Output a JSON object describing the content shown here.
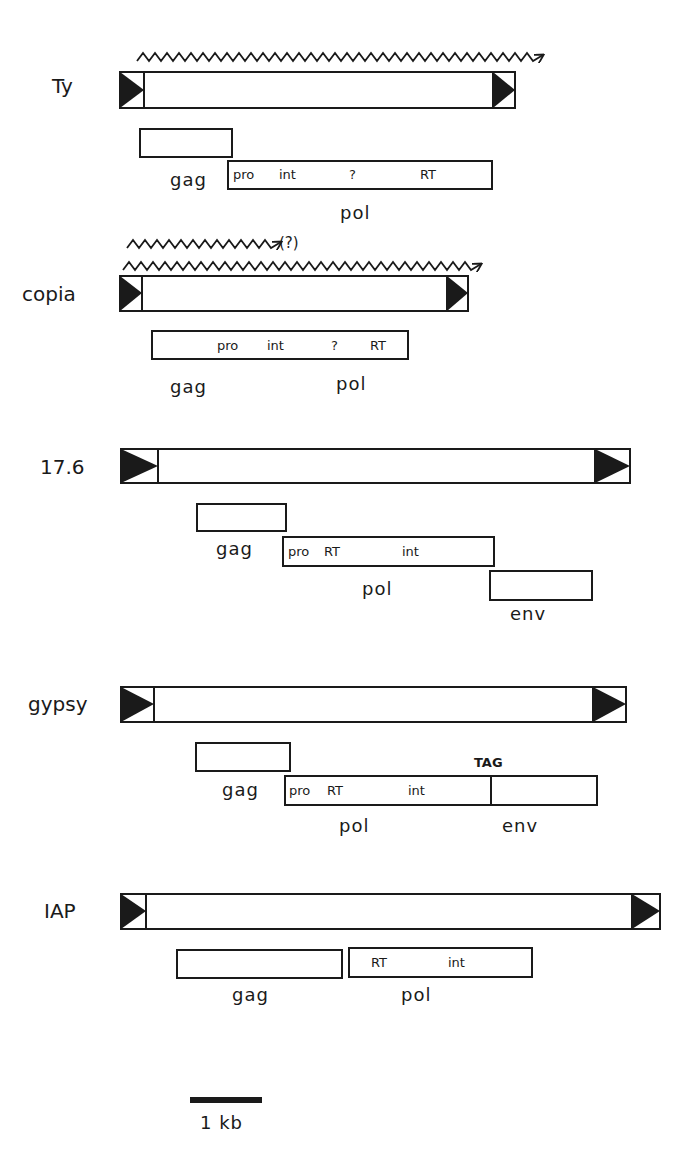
{
  "figure": {
    "corner_text": "",
    "scale_bar": {
      "label": "1 kb",
      "x1": 190,
      "x2": 262,
      "y": 1100
    },
    "elements": [
      {
        "name": "Ty",
        "label_pos": [
          52,
          86
        ],
        "body": {
          "x": 120,
          "y": 72,
          "w": 395,
          "h": 36,
          "ltr_w": 24
        },
        "transcripts": [
          {
            "x1": 137,
            "x2": 515,
            "y": 53,
            "note": ""
          }
        ],
        "orfs": [
          {
            "label": "gag",
            "x": 140,
            "y": 129,
            "w": 92,
            "h": 28,
            "label_pos": [
              170,
              185
            ],
            "domains": []
          },
          {
            "label": "pol",
            "x": 228,
            "y": 161,
            "w": 264,
            "h": 28,
            "label_pos": [
              340,
              218
            ],
            "domains": [
              {
                "text": "pro",
                "x": 233
              },
              {
                "text": "int",
                "x": 279
              },
              {
                "text": "?",
                "x": 348
              },
              {
                "text": "RT",
                "x": 420
              }
            ]
          }
        ]
      },
      {
        "name": "copia",
        "label_pos": [
          22,
          299
        ],
        "body": {
          "x": 120,
          "y": 276,
          "w": 348,
          "h": 35,
          "ltr_w": 22
        },
        "transcripts": [
          {
            "x1": 127,
            "x2": 278,
            "y": 241,
            "note": "(?)"
          },
          {
            "x1": 123,
            "x2": 470,
            "y": 263,
            "note": ""
          }
        ],
        "orfs": [
          {
            "label": "gag",
            "x": 152,
            "y": 331,
            "w": 256,
            "h": 28,
            "label_pos": [
              170,
              392
            ],
            "domains": [
              {
                "text": "pro",
                "x": 217
              },
              {
                "text": "int",
                "x": 268
              },
              {
                "text": "?",
                "x": 330
              },
              {
                "text": "RT",
                "x": 370
              }
            ]
          },
          {
            "label": "pol",
            "x": 0,
            "y": 0,
            "w": 0,
            "h": 0,
            "label_pos": [
              336,
              392
            ],
            "domains": []
          }
        ]
      },
      {
        "name": "17.6",
        "label_pos": [
          40,
          476
        ],
        "body": {
          "x": 120,
          "y": 448,
          "w": 510,
          "h": 35,
          "ltr_w": 38
        },
        "transcripts": [],
        "orfs": [
          {
            "label": "gag",
            "x": 197,
            "y": 504,
            "w": 89,
            "h": 27,
            "label_pos": [
              216,
              555
            ],
            "domains": []
          },
          {
            "label": "pol",
            "x": 283,
            "y": 537,
            "w": 211,
            "h": 29,
            "label_pos": [
              362,
              595
            ],
            "domains": [
              {
                "text": "pro",
                "x": 288
              },
              {
                "text": "RT",
                "x": 323
              },
              {
                "text": "int",
                "x": 402
              }
            ]
          },
          {
            "label": "env",
            "x": 490,
            "y": 571,
            "w": 102,
            "h": 29,
            "label_pos": [
              510,
              622
            ],
            "domains": []
          }
        ]
      },
      {
        "name": "gypsy",
        "label_pos": [
          28,
          713
        ],
        "body": {
          "x": 120,
          "y": 687,
          "w": 506,
          "h": 35,
          "ltr_w": 34
        },
        "transcripts": [],
        "orfs": [
          {
            "label": "gag",
            "x": 196,
            "y": 743,
            "w": 94,
            "h": 28,
            "label_pos": [
              222,
              796
            ],
            "domains": []
          },
          {
            "label": "pol",
            "x": 285,
            "y": 776,
            "w": 206,
            "h": 29,
            "label_pos": [
              339,
              834
            ],
            "domains": [
              {
                "text": "pro",
                "x": 289
              },
              {
                "text": "RT",
                "x": 327
              },
              {
                "text": "int",
                "x": 408
              }
            ]
          },
          {
            "label": "env",
            "x": 491,
            "y": 776,
            "w": 106,
            "h": 29,
            "label_pos": [
              502,
              834
            ],
            "domains": []
          }
        ],
        "annotation": {
          "text": "TAG",
          "x": 474,
          "y": 768
        }
      },
      {
        "name": "IAP",
        "label_pos": [
          44,
          920
        ],
        "body": {
          "x": 120,
          "y": 894,
          "w": 540,
          "h": 35,
          "ltr_w": 26
        },
        "transcripts": [],
        "orfs": [
          {
            "label": "gag",
            "x": 177,
            "y": 950,
            "w": 165,
            "h": 28,
            "label_pos": [
              232,
              1001
            ],
            "domains": []
          },
          {
            "label": "pol",
            "x": 349,
            "y": 948,
            "w": 183,
            "h": 29,
            "label_pos": [
              401,
              1001
            ],
            "domains": [
              {
                "text": "RT",
                "x": 371
              },
              {
                "text": "int",
                "x": 448
              }
            ]
          }
        ]
      }
    ]
  },
  "text": {
    "ty": "Ty",
    "copia": "copia",
    "e176": "17.6",
    "gypsy": "gypsy",
    "iap": "IAP",
    "gag": "gag",
    "pol": "pol",
    "env": "env",
    "pro": "pro",
    "int": "int",
    "rt": "RT",
    "q": "?",
    "tag": "TAG",
    "qparen": "(?)",
    "scale": "1 kb"
  }
}
